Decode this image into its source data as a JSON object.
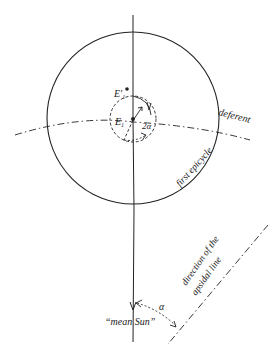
{
  "diagram": {
    "labels": {
      "deferent": "deferent",
      "first_epicycle": "first epicycle",
      "apsidal_line_1": "direction of the",
      "apsidal_line_2": "apsidal line",
      "mean_sun": "“mean Sun”",
      "alpha": "α",
      "two_alpha": "2α",
      "E1_prime": "E′",
      "E1_prime_sub": "1",
      "E1": "E",
      "E1_sub": "1"
    },
    "colors": {
      "stroke": "#222222",
      "background": "#ffffff"
    }
  }
}
